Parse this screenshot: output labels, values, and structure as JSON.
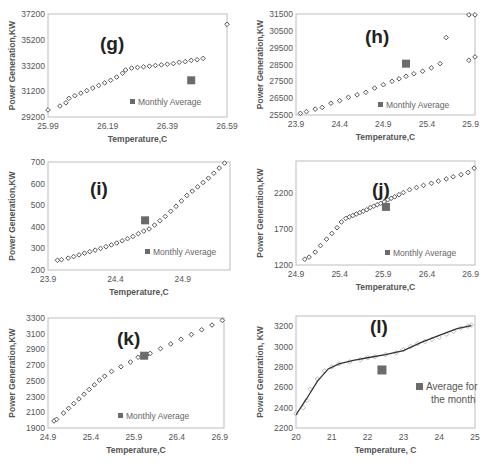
{
  "chart_data": [
    {
      "id": "g",
      "type": "scatter",
      "panel_label": "(g)",
      "xlabel": "Temperature,C",
      "ylabel": "Power Generation,KW",
      "xlim": [
        25.99,
        26.59
      ],
      "ylim": [
        29200,
        37200
      ],
      "xticks": [
        "25.99",
        "26.19",
        "26.39",
        "26.59"
      ],
      "yticks": [
        "29200",
        "31200",
        "33200",
        "35200",
        "37200"
      ],
      "legend": "Monthly Average",
      "series": [
        {
          "name": "Power vs Temperature",
          "marker": "diamond-open",
          "x": [
            25.99,
            26.03,
            26.05,
            26.06,
            26.08,
            26.1,
            26.12,
            26.14,
            26.16,
            26.18,
            26.2,
            26.22,
            26.24,
            26.25,
            26.27,
            26.29,
            26.31,
            26.33,
            26.35,
            26.37,
            26.39,
            26.41,
            26.43,
            26.45,
            26.47,
            26.49,
            26.51,
            26.59
          ],
          "y": [
            29750,
            30050,
            30300,
            30650,
            30850,
            31050,
            31250,
            31450,
            31650,
            31850,
            32050,
            32300,
            32600,
            32850,
            33000,
            33050,
            33100,
            33150,
            33200,
            33250,
            33300,
            33350,
            33450,
            33500,
            33600,
            33650,
            33750,
            36400
          ]
        },
        {
          "name": "Monthly Average",
          "marker": "square-filled",
          "x": [
            26.47
          ],
          "y": [
            32050
          ]
        }
      ]
    },
    {
      "id": "h",
      "type": "scatter",
      "panel_label": "(h)",
      "xlabel": "Temperature,C",
      "ylabel": "Power Generation,KW",
      "xlim": [
        23.9,
        25.95
      ],
      "ylim": [
        25500,
        31500
      ],
      "xticks": [
        "23.9",
        "24.4",
        "24.9",
        "25.4",
        "25.9"
      ],
      "yticks": [
        "25500",
        "26500",
        "27500",
        "28500",
        "29500",
        "30500",
        "31500"
      ],
      "legend": "Monthly Average",
      "series": [
        {
          "name": "Power vs Temperature",
          "marker": "diamond-open",
          "x": [
            23.95,
            24.02,
            24.12,
            24.2,
            24.3,
            24.4,
            24.5,
            24.6,
            24.7,
            24.8,
            24.9,
            25.0,
            25.08,
            25.16,
            25.25,
            25.35,
            25.45,
            25.55,
            25.88,
            25.95
          ],
          "y": [
            25600,
            25700,
            25850,
            25950,
            26200,
            26350,
            26550,
            26700,
            26850,
            27100,
            27300,
            27500,
            27650,
            27800,
            27950,
            28100,
            28300,
            28550,
            28750,
            28950
          ]
        },
        {
          "name": "Power vs Temperature (upper)",
          "marker": "diamond-open",
          "x": [
            25.62,
            25.88,
            25.95
          ],
          "y": [
            30100,
            31450,
            31450
          ]
        },
        {
          "name": "Monthly Average",
          "marker": "square-filled",
          "x": [
            25.16
          ],
          "y": [
            28550
          ]
        }
      ]
    },
    {
      "id": "i",
      "type": "scatter",
      "panel_label": "(i)",
      "xlabel": "Temperature,C",
      "ylabel": "Power Generation,KW",
      "xlim": [
        23.9,
        25.25
      ],
      "ylim": [
        200,
        700
      ],
      "xticks": [
        "23.9",
        "24.4",
        "24.9"
      ],
      "yticks": [
        "200",
        "300",
        "400",
        "500",
        "600",
        "700"
      ],
      "legend": "Monthly Average",
      "series": [
        {
          "name": "Power vs Temperature",
          "marker": "diamond-open",
          "x": [
            23.97,
            24.0,
            24.05,
            24.09,
            24.13,
            24.17,
            24.21,
            24.25,
            24.29,
            24.33,
            24.37,
            24.41,
            24.45,
            24.49,
            24.53,
            24.57,
            24.61,
            24.65,
            24.69,
            24.73,
            24.77,
            24.81,
            24.85,
            24.89,
            24.93,
            24.97,
            25.01,
            25.05,
            25.09,
            25.13,
            25.17,
            25.21
          ],
          "y": [
            245,
            248,
            255,
            262,
            270,
            278,
            285,
            292,
            300,
            308,
            316,
            325,
            335,
            345,
            355,
            368,
            380,
            390,
            408,
            428,
            448,
            472,
            495,
            520,
            545,
            565,
            585,
            605,
            625,
            648,
            672,
            695
          ]
        },
        {
          "name": "Monthly Average",
          "marker": "square-filled",
          "x": [
            24.62
          ],
          "y": [
            430
          ]
        }
      ]
    },
    {
      "id": "j",
      "type": "scatter",
      "panel_label": "(j)",
      "xlabel": "Temperature,C",
      "ylabel": "Power Generation,KW",
      "xlim": [
        24.9,
        26.95
      ],
      "ylim": [
        1200,
        2650
      ],
      "xticks": [
        "24.9",
        "25.4",
        "25.9",
        "26.4",
        "26.9"
      ],
      "yticks": [
        "1200",
        "1700",
        "2200"
      ],
      "legend": "Monthly Average",
      "series": [
        {
          "name": "Power vs Temperature",
          "marker": "diamond-open",
          "x": [
            25.0,
            25.05,
            25.12,
            25.18,
            25.25,
            25.31,
            25.37,
            25.42,
            25.47,
            25.51,
            25.55,
            25.59,
            25.63,
            25.67,
            25.71,
            25.75,
            25.79,
            25.83,
            25.87,
            25.91,
            25.95,
            25.99,
            26.03,
            26.08,
            26.13,
            26.2,
            26.28,
            26.36,
            26.45,
            26.53,
            26.62,
            26.7,
            26.79,
            26.87,
            26.94
          ],
          "y": [
            1280,
            1310,
            1380,
            1470,
            1560,
            1640,
            1720,
            1800,
            1850,
            1870,
            1890,
            1910,
            1930,
            1950,
            1970,
            2000,
            2020,
            2040,
            2060,
            2080,
            2110,
            2130,
            2150,
            2180,
            2210,
            2250,
            2280,
            2310,
            2340,
            2370,
            2400,
            2430,
            2460,
            2490,
            2550
          ]
        },
        {
          "name": "Monthly Average",
          "marker": "square-filled",
          "x": [
            25.93
          ],
          "y": [
            2010
          ]
        }
      ]
    },
    {
      "id": "k",
      "type": "scatter",
      "panel_label": "(k)",
      "xlabel": "Temperature,C",
      "ylabel": "Power Generation,KW",
      "xlim": [
        24.9,
        26.95
      ],
      "ylim": [
        1900,
        3300
      ],
      "xticks": [
        "24.9",
        "25.4",
        "25.9",
        "26.4",
        "26.9"
      ],
      "yticks": [
        "1900",
        "2100",
        "2300",
        "2500",
        "2700",
        "2900",
        "3100",
        "3300"
      ],
      "legend": "Monthly Average",
      "series": [
        {
          "name": "Power vs Temperature",
          "marker": "diamond-open",
          "x": [
            24.97,
            25.0,
            25.08,
            25.14,
            25.2,
            25.26,
            25.32,
            25.38,
            25.44,
            25.5,
            25.56,
            25.64,
            25.75,
            25.86,
            25.95,
            25.99,
            26.02,
            26.05,
            26.09,
            26.21,
            26.33,
            26.45,
            26.57,
            26.69,
            26.81,
            26.93
          ],
          "y": [
            1990,
            2010,
            2090,
            2150,
            2210,
            2270,
            2330,
            2390,
            2450,
            2510,
            2560,
            2620,
            2680,
            2740,
            2800,
            2810,
            2820,
            2830,
            2850,
            2910,
            2970,
            3030,
            3090,
            3150,
            3210,
            3270
          ]
        },
        {
          "name": "Monthly Average",
          "marker": "square-filled",
          "x": [
            26.02
          ],
          "y": [
            2820
          ]
        }
      ]
    },
    {
      "id": "l",
      "type": "scatter",
      "panel_label": "(l)",
      "xlabel": "Temperature, C",
      "ylabel": "Power Generation, KW",
      "xlim": [
        20,
        25
      ],
      "ylim": [
        2200,
        3300
      ],
      "xticks": [
        "20",
        "21",
        "22",
        "23",
        "24",
        "25"
      ],
      "yticks": [
        "2200",
        "2400",
        "2600",
        "2800",
        "3000",
        "3200"
      ],
      "legend": "Average for the month",
      "series": [
        {
          "name": "Power vs Temperature",
          "marker": "diamond-open-light",
          "x": [
            20.0,
            20.2,
            20.3,
            20.4,
            20.6,
            20.8,
            21.0,
            21.2,
            21.5,
            21.8,
            22.0,
            22.2,
            22.5,
            22.8,
            23.0,
            23.2,
            23.4,
            23.6,
            23.8,
            24.0,
            24.2,
            24.4,
            24.6,
            24.8,
            24.9
          ],
          "y": [
            2340,
            2400,
            2470,
            2580,
            2680,
            2760,
            2800,
            2830,
            2850,
            2870,
            2890,
            2900,
            2920,
            2940,
            2970,
            3000,
            3030,
            3050,
            3070,
            3090,
            3120,
            3150,
            3180,
            3200,
            3210
          ]
        },
        {
          "name": "Trend line",
          "marker": "line",
          "x": [
            20.0,
            20.3,
            20.6,
            20.9,
            21.2,
            21.6,
            22.0,
            22.5,
            23.0,
            23.5,
            24.0,
            24.5,
            24.9
          ],
          "y": [
            2330,
            2490,
            2660,
            2780,
            2830,
            2865,
            2890,
            2920,
            2960,
            3040,
            3110,
            3175,
            3205
          ]
        },
        {
          "name": "Average for the month",
          "marker": "square-filled",
          "x": [
            22.4
          ],
          "y": [
            2770
          ]
        }
      ]
    }
  ]
}
